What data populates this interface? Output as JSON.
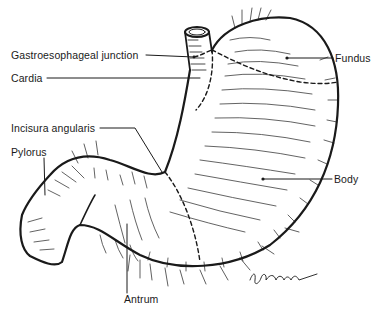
{
  "figure": {
    "labels": {
      "ge_junction": "Gastroesophageal junction",
      "cardia": "Cardia",
      "fundus": "Fundus",
      "incisura": "Incisura angularis",
      "pylorus": "Pylorus",
      "body": "Body",
      "antrum": "Antrum"
    },
    "signature": "D. Longenfeld",
    "colors": {
      "ink": "#1a1a1a",
      "background": "#ffffff"
    }
  }
}
